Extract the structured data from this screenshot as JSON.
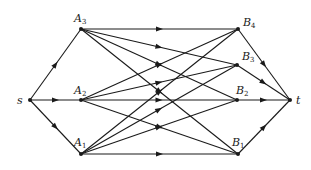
{
  "diagram": {
    "type": "directed-network",
    "colors": {
      "stroke": "#1a1a1a",
      "background": "#ffffff"
    },
    "nodes": [
      {
        "id": "s",
        "label": "s",
        "sub": "",
        "x": 30,
        "y": 100,
        "lx": 17,
        "ly": 104
      },
      {
        "id": "A3",
        "label": "A",
        "sub": "3",
        "x": 81,
        "y": 29,
        "lx": 74,
        "ly": 22
      },
      {
        "id": "A2",
        "label": "A",
        "sub": "2",
        "x": 81,
        "y": 100,
        "lx": 74,
        "ly": 94
      },
      {
        "id": "A1",
        "label": "A",
        "sub": "1",
        "x": 81,
        "y": 154,
        "lx": 74,
        "ly": 146
      },
      {
        "id": "B4",
        "label": "B",
        "sub": "4",
        "x": 238,
        "y": 29,
        "lx": 243,
        "ly": 26
      },
      {
        "id": "B3",
        "label": "B",
        "sub": "3",
        "x": 237,
        "y": 65,
        "lx": 242,
        "ly": 60
      },
      {
        "id": "B2",
        "label": "B",
        "sub": "2",
        "x": 237,
        "y": 100,
        "lx": 236,
        "ly": 94
      },
      {
        "id": "B1",
        "label": "B",
        "sub": "1",
        "x": 238,
        "y": 154,
        "lx": 232,
        "ly": 146
      },
      {
        "id": "t",
        "label": "t",
        "sub": "",
        "x": 290,
        "y": 100,
        "lx": 296,
        "ly": 104
      }
    ],
    "edges": [
      [
        "s",
        "A1"
      ],
      [
        "s",
        "A2"
      ],
      [
        "s",
        "A3"
      ],
      [
        "A3",
        "B4"
      ],
      [
        "A3",
        "B3"
      ],
      [
        "A3",
        "B2"
      ],
      [
        "A3",
        "B1"
      ],
      [
        "A2",
        "B4"
      ],
      [
        "A2",
        "B3"
      ],
      [
        "A2",
        "B2"
      ],
      [
        "A2",
        "B1"
      ],
      [
        "A1",
        "B4"
      ],
      [
        "A1",
        "B3"
      ],
      [
        "A1",
        "B2"
      ],
      [
        "A1",
        "B1"
      ],
      [
        "B4",
        "t"
      ],
      [
        "B3",
        "t"
      ],
      [
        "B2",
        "t"
      ],
      [
        "B1",
        "t"
      ]
    ]
  }
}
